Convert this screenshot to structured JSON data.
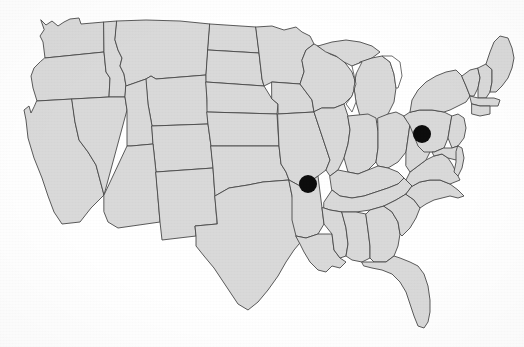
{
  "figure": {
    "type": "choropleth-locator-map",
    "width": 524,
    "height": 347,
    "background_color": "#ffffff",
    "land_fill_color": "#d9d9d9",
    "border_stroke_color": "#4a4a4a",
    "lake_fill_color": "#ffffff",
    "marker_color": "#0d0d0d",
    "projection_note": "contiguous United States, state outlines",
    "rendering_note": "grayscale scanned line map, no labels, no legend, no title text"
  },
  "markers": [
    {
      "id": "marker-missouri",
      "label": "Missouri",
      "shape": "filled-circle",
      "color": "#0d0d0d",
      "cx": 308,
      "cy": 184,
      "r": 9
    },
    {
      "id": "marker-pennsylvania",
      "label": "Pennsylvania",
      "shape": "filled-circle",
      "color": "#0d0d0d",
      "cx": 422,
      "cy": 134,
      "r": 9
    }
  ],
  "chart_data": {
    "type": "map",
    "title": "",
    "xlabel": "",
    "ylabel": "",
    "legend": [],
    "marker_count": 2,
    "highlighted_locations": [
      "Missouri",
      "Pennsylvania"
    ],
    "values": [
      1,
      1
    ],
    "categories": [
      "Missouri",
      "Pennsylvania"
    ]
  }
}
